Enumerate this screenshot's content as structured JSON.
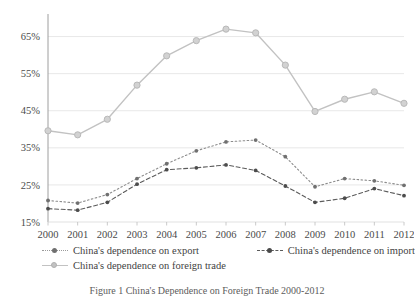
{
  "chart_data": {
    "type": "line",
    "title": "",
    "xlabel": "",
    "ylabel": "",
    "categories": [
      "2000",
      "2001",
      "2002",
      "2003",
      "2004",
      "2005",
      "2006",
      "2007",
      "2008",
      "2009",
      "2010",
      "2011",
      "2012"
    ],
    "ylim": [
      15,
      70
    ],
    "yticks": [
      15,
      25,
      35,
      45,
      55,
      65
    ],
    "ytick_labels": [
      "15%",
      "25%",
      "35%",
      "45%",
      "55%",
      "65%"
    ],
    "grid": true,
    "legend_position": "bottom",
    "series": [
      {
        "name": "China's dependence on export",
        "values": [
          20.8,
          20.1,
          22.4,
          26.7,
          30.7,
          34.2,
          36.6,
          37.1,
          32.6,
          24.5,
          26.7,
          26.1,
          24.9
        ],
        "color": "#8c8c8c",
        "dash": "dotted",
        "marker": "dot"
      },
      {
        "name": "China's dependence on import",
        "values": [
          18.6,
          18.2,
          20.3,
          25.2,
          29.1,
          29.6,
          30.4,
          28.9,
          24.7,
          20.3,
          21.4,
          24.0,
          22.1
        ],
        "color": "#5b5b5b",
        "dash": "dashed",
        "marker": "dot"
      },
      {
        "name": "China's dependence on foreign trade",
        "values": [
          39.6,
          38.5,
          42.7,
          51.9,
          59.8,
          63.9,
          67.0,
          66.0,
          57.3,
          44.8,
          48.1,
          50.1,
          47.0
        ],
        "color": "#c2c2c2",
        "dash": "solid",
        "marker": "circle"
      }
    ]
  },
  "legend": {
    "items": [
      {
        "label": "China's dependence on export"
      },
      {
        "label": "China's dependence on import"
      },
      {
        "label": "China's dependence on foreign trade"
      }
    ]
  },
  "caption": {
    "text": "Figure 1    China's Dependence on Foreign Trade 2000-2012"
  }
}
